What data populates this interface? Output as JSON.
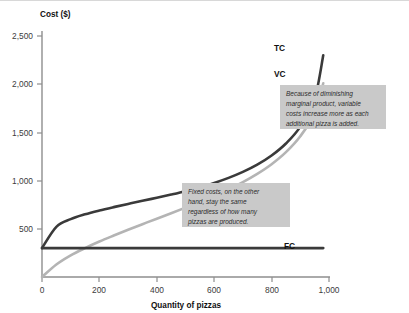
{
  "chart_data": {
    "type": "line",
    "title": "",
    "xlabel": "Quantity of pizzas",
    "ylabel": "Cost ($)",
    "xlim": [
      0,
      1050
    ],
    "ylim": [
      0,
      2600
    ],
    "grid": false,
    "legend_position": "inline-right-of-curve-ends",
    "xticks": [
      "0",
      "200",
      "400",
      "600",
      "800",
      "1,000"
    ],
    "xtick_values": [
      0,
      200,
      400,
      600,
      800,
      1000
    ],
    "yticks": [
      "500",
      "1,000",
      "1,500",
      "2,000",
      "2,500"
    ],
    "ytick_values": [
      500,
      1000,
      1500,
      2000,
      2500
    ],
    "x": [
      0,
      50,
      100,
      150,
      200,
      250,
      300,
      350,
      400,
      450,
      500,
      550,
      600,
      650,
      700,
      750,
      800,
      850,
      900,
      950,
      980
    ],
    "series": [
      {
        "name": "TC",
        "label": "TC",
        "color": "#3a3a3a",
        "width": 2.6,
        "description": "Total cost curve",
        "values": [
          300,
          520,
          600,
          650,
          690,
          725,
          758,
          790,
          822,
          855,
          890,
          930,
          975,
          1028,
          1090,
          1165,
          1260,
          1385,
          1560,
          1850,
          2300
        ]
      },
      {
        "name": "VC",
        "label": "VC",
        "color": "#b4b4b4",
        "width": 2.6,
        "description": "Variable cost curve",
        "values": [
          0,
          130,
          225,
          300,
          368,
          430,
          490,
          548,
          605,
          662,
          720,
          780,
          843,
          910,
          985,
          1070,
          1170,
          1295,
          1460,
          1700,
          2010
        ]
      },
      {
        "name": "FC",
        "label": "FC",
        "color": "#3a3a3a",
        "width": 2.6,
        "description": "Fixed cost line, constant",
        "values": [
          300,
          300,
          300,
          300,
          300,
          300,
          300,
          300,
          300,
          300,
          300,
          300,
          300,
          300,
          300,
          300,
          300,
          300,
          300,
          300,
          300
        ]
      }
    ],
    "annotations": [
      {
        "id": "variable-cost-note",
        "lines": [
          "Because of diminishing",
          "marginal product, variable",
          "costs increase more as each",
          "additional pizza is added."
        ],
        "text": "Because of diminishing marginal product, variable costs increase more as each additional pizza is added.",
        "box_color": "#c9c9c9"
      },
      {
        "id": "fixed-cost-note",
        "lines": [
          "Fixed costs, on the other",
          "hand, stay the same",
          "regardless of how many",
          "pizzas are produced."
        ],
        "text": "Fixed costs, on the other hand, stay the same regardless of how many pizzas are produced.",
        "box_color": "#c9c9c9"
      }
    ],
    "axis_color": "#8e8e8e",
    "text_color": "#111111"
  }
}
